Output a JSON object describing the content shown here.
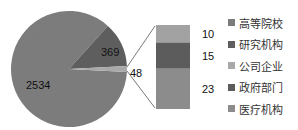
{
  "chart_data": {
    "type": "pie",
    "subtype": "bar-of-pie",
    "pie": {
      "slices": [
        {
          "label": "2534",
          "value": 2534,
          "color": "#7c7c7c"
        },
        {
          "label": "369",
          "value": 369,
          "color": "#5e5e5e"
        },
        {
          "label": "48",
          "value": 48,
          "color": "#a9a9a9",
          "note": "other (expanded in bar)"
        }
      ]
    },
    "bar": {
      "segments": [
        {
          "label": "10",
          "value": 10,
          "color": "#a2a2a2"
        },
        {
          "label": "15",
          "value": 15,
          "color": "#5c5c5c"
        },
        {
          "label": "23",
          "value": 23,
          "color": "#8c8c8c"
        }
      ]
    },
    "legend": [
      {
        "label": "高等院校",
        "color": "#7c7c7c"
      },
      {
        "label": "研究机构",
        "color": "#5e5e5e"
      },
      {
        "label": "公司企业",
        "color": "#a9a9a9"
      },
      {
        "label": "政府部门",
        "color": "#5c5c5c"
      },
      {
        "label": "医疗机构",
        "color": "#8c8c8c"
      }
    ],
    "legend_position": "right",
    "title": ""
  }
}
